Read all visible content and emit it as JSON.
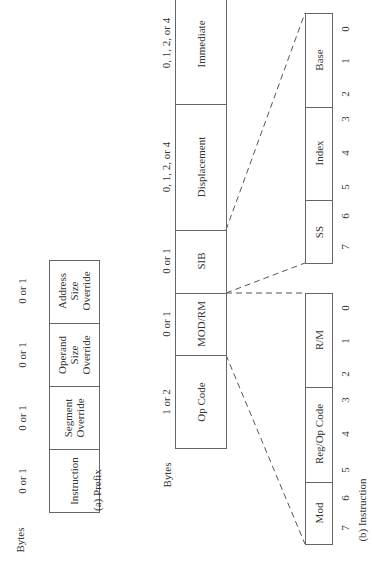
{
  "orientation": "rotated-90-ccw",
  "prefix": {
    "bytes_label": "Bytes",
    "caption": "(a) Prefix",
    "fields": [
      {
        "label": "Instruction",
        "bytes": "0 or 1"
      },
      {
        "label": "Segment\nOverride",
        "bytes": "0 or 1"
      },
      {
        "label": "Operand\nSize\nOverride",
        "bytes": "0 or 1"
      },
      {
        "label": "Address\nSize\nOverride",
        "bytes": "0 or 1"
      }
    ]
  },
  "instruction": {
    "bytes_label": "Bytes",
    "caption": "(b) Instruction",
    "fields": [
      {
        "label": "Op Code",
        "bytes": "1 or 2"
      },
      {
        "label": "MOD/RM",
        "bytes": "0 or 1"
      },
      {
        "label": "SIB",
        "bytes": "0 or 1"
      },
      {
        "label": "Displacement",
        "bytes": "0, 1, 2, or 4"
      },
      {
        "label": "Immediate",
        "bytes": "0, 1, 2, or 4"
      }
    ],
    "modrm_breakdown": {
      "fields": [
        {
          "label": "Mod",
          "bits": "7-6"
        },
        {
          "label": "Reg/Op Code",
          "bits": "5-3"
        },
        {
          "label": "R/M",
          "bits": "2-0"
        }
      ],
      "bit_numbers": [
        "7",
        "6",
        "5",
        "4",
        "3",
        "2",
        "1",
        "0"
      ]
    },
    "sib_breakdown": {
      "fields": [
        {
          "label": "SS",
          "bits": "7-6"
        },
        {
          "label": "Index",
          "bits": "5-3"
        },
        {
          "label": "Base",
          "bits": "2-0"
        }
      ],
      "bit_numbers": [
        "7",
        "6",
        "5",
        "4",
        "3",
        "2",
        "1",
        "0"
      ]
    }
  }
}
